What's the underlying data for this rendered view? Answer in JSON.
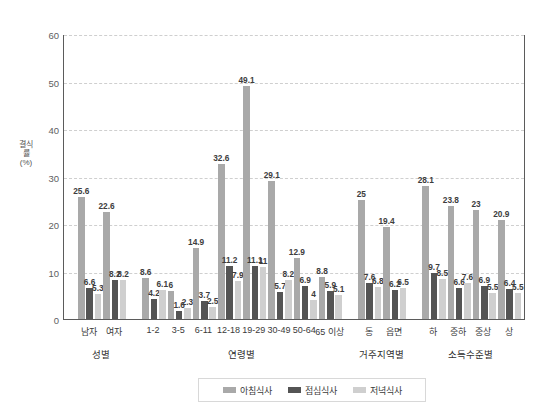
{
  "chart_data": {
    "type": "bar",
    "title": "",
    "subtitle": "",
    "xlabel": "",
    "ylabel": "결식률(%)",
    "ylim": [
      0,
      60
    ],
    "ytick_values": [
      0,
      10,
      20,
      30,
      40,
      50,
      60
    ],
    "ytick_labels": [
      "0",
      "10",
      "20",
      "30",
      "40",
      "50",
      "60"
    ],
    "grid": true,
    "legend_position": "bottom",
    "group_labels": [
      "성별",
      "연령별",
      "거주지역별",
      "소득수준별"
    ],
    "categories": [
      "남자",
      "여자",
      "1-2",
      "3-5",
      "6-11",
      "12-18",
      "19-29",
      "30-49",
      "50-64",
      "65 이상",
      "동",
      "읍면",
      "하",
      "중하",
      "중상",
      "상"
    ],
    "category_groups": [
      {
        "name": "성별",
        "categories": [
          "남자",
          "여자"
        ]
      },
      {
        "name": "연령별",
        "categories": [
          "1-2",
          "3-5",
          "6-11",
          "12-18",
          "19-29",
          "30-49",
          "50-64",
          "65 이상"
        ]
      },
      {
        "name": "거주지역별",
        "categories": [
          "동",
          "읍면"
        ]
      },
      {
        "name": "소득수준별",
        "categories": [
          "하",
          "중하",
          "중상",
          "상"
        ]
      }
    ],
    "series": [
      {
        "name": "아침식사",
        "color": "#a9a9a9",
        "values": [
          25.6,
          22.6,
          8.6,
          6,
          14.9,
          32.6,
          49.1,
          29.1,
          12.9,
          8.8,
          25,
          19.4,
          28.1,
          23.8,
          23,
          20.9
        ],
        "labels": [
          "25.6",
          "22.6",
          "8.6",
          "6",
          "14.9",
          "32.6",
          "49.1",
          "29.1",
          "12.9",
          "8.8",
          "25",
          "19.4",
          "28.1",
          "23.8",
          "23",
          "20.9"
        ]
      },
      {
        "name": "점심식사",
        "color": "#545454",
        "values": [
          6.6,
          8.2,
          4.2,
          1.6,
          3.7,
          11.2,
          11.1,
          5.7,
          6.9,
          5.9,
          7.6,
          6.2,
          9.7,
          6.6,
          6.9,
          6.4
        ],
        "labels": [
          "6.6",
          "8.2",
          "4.2",
          "1.6",
          "3.7",
          "11.2",
          "11.1",
          "5.7",
          "6.9",
          "5.9",
          "7.6",
          "6.2",
          "9.7",
          "6.6",
          "6.9",
          "6.4"
        ]
      },
      {
        "name": "저녁식사",
        "color": "#cfcfcf",
        "values": [
          5.3,
          8.2,
          6.1,
          2.3,
          2.5,
          7.9,
          11,
          8.2,
          4,
          5.1,
          6.8,
          6.5,
          8.5,
          7.6,
          5.5,
          5.5
        ],
        "labels": [
          "5.3",
          "8.2",
          "6.1",
          "2.3",
          "2.5",
          "7.9",
          "11",
          "8.2",
          "4",
          "5.1",
          "6.8",
          "6.5",
          "8.5",
          "7.6",
          "5.5",
          "5.5"
        ]
      }
    ],
    "legend": [
      {
        "label": "아침식사",
        "color": "#a9a9a9"
      },
      {
        "label": "점심식사",
        "color": "#545454"
      },
      {
        "label": "저녁식사",
        "color": "#cfcfcf"
      }
    ]
  }
}
